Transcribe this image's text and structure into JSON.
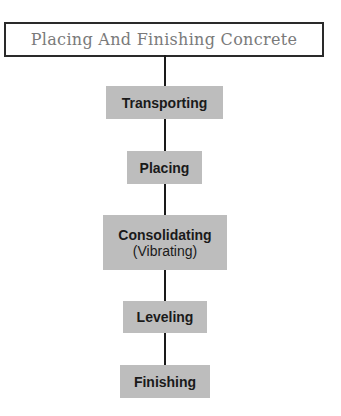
{
  "diagram": {
    "title": "Placing And Finishing Concrete",
    "steps": [
      {
        "label": "Transporting"
      },
      {
        "label": "Placing"
      },
      {
        "label": "Consolidating",
        "sublabel": "(Vibrating)"
      },
      {
        "label": "Leveling"
      },
      {
        "label": "Finishing"
      }
    ],
    "colors": {
      "step_fill": "#bdbdbd",
      "connector": "#1a1a1a",
      "title_border": "#2a2a2a",
      "title_text": "#7a7a7a"
    }
  }
}
